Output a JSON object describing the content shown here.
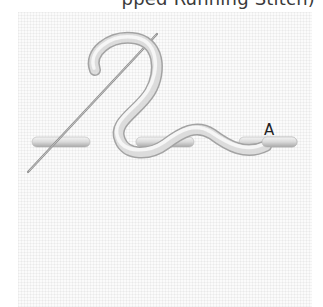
{
  "title_visible": "pped Running Stitch)",
  "diagram": {
    "labels": [
      {
        "id": "A",
        "text": "A"
      }
    ],
    "elements": {
      "running_stitches": 3,
      "whip_thread": "white thread wrapping stitches",
      "needle": "diagonal needle"
    },
    "colors": {
      "fabric": "#fbfbfb",
      "thread": "#e6e6e6",
      "thread_shadow": "#a9a9a9",
      "needle": "#9a9a9a",
      "text": "#3a3a3a"
    }
  }
}
